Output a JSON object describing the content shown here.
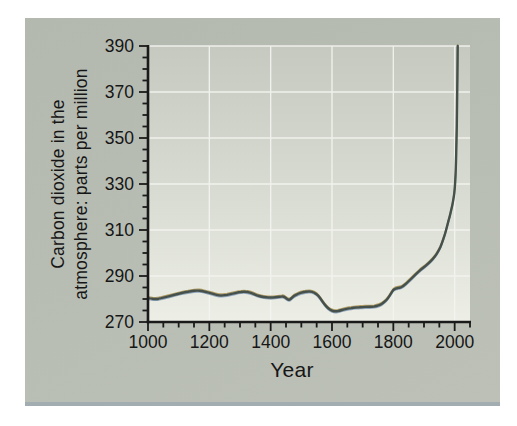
{
  "figure": {
    "xlabel": "Year",
    "ylabel_line1": "Carbon dioxide in the",
    "ylabel_line2": "atmosphere: parts per million",
    "colors": {
      "page_background": "#ffffff",
      "card_background": "#b8bcb3",
      "card_bottom_edge": "#a2adb2",
      "plot_background_top": "#c5c9c0",
      "plot_background_bottom": "#edefe7",
      "gridline": "#f4f5f0",
      "axis": "#1a1a1a",
      "text": "#161616",
      "line_main": "#46514b",
      "line_highlight": "#b29e67",
      "line_shadow": "#90a5bc"
    }
  },
  "chart_data": {
    "type": "line",
    "title": "",
    "xlabel": "Year",
    "ylabel": "Carbon dioxide in the atmosphere: parts per million",
    "xlim": [
      1000,
      2050
    ],
    "ylim": [
      270,
      390
    ],
    "x_major_ticks": [
      1000,
      1200,
      1400,
      1600,
      1800,
      2000
    ],
    "x_tick_labels": [
      "1000",
      "1200",
      "1400",
      "1600",
      "1800",
      "2000"
    ],
    "x_minor_step": 50,
    "y_major_ticks": [
      270,
      290,
      310,
      330,
      350,
      370,
      390
    ],
    "y_tick_labels": [
      "270",
      "290",
      "310",
      "330",
      "350",
      "370",
      "390"
    ],
    "y_minor_step": 5,
    "grid": true,
    "legend": "none",
    "series": [
      {
        "name": "CO2 concentration (ppm)",
        "points": [
          [
            1000,
            280.4
          ],
          [
            1010,
            280.2
          ],
          [
            1020,
            280.0
          ],
          [
            1030,
            280.0
          ],
          [
            1040,
            280.3
          ],
          [
            1060,
            280.9
          ],
          [
            1080,
            281.6
          ],
          [
            1100,
            282.3
          ],
          [
            1120,
            282.9
          ],
          [
            1140,
            283.4
          ],
          [
            1160,
            283.7
          ],
          [
            1175,
            283.5
          ],
          [
            1190,
            283.0
          ],
          [
            1205,
            282.5
          ],
          [
            1220,
            281.9
          ],
          [
            1235,
            281.5
          ],
          [
            1250,
            281.6
          ],
          [
            1265,
            282.0
          ],
          [
            1280,
            282.5
          ],
          [
            1295,
            282.9
          ],
          [
            1310,
            283.2
          ],
          [
            1325,
            283.1
          ],
          [
            1340,
            282.5
          ],
          [
            1355,
            281.6
          ],
          [
            1370,
            281.0
          ],
          [
            1385,
            280.7
          ],
          [
            1400,
            280.6
          ],
          [
            1415,
            280.7
          ],
          [
            1430,
            281.0
          ],
          [
            1442,
            281.2
          ],
          [
            1450,
            280.4
          ],
          [
            1458,
            279.6
          ],
          [
            1465,
            279.9
          ],
          [
            1475,
            281.3
          ],
          [
            1490,
            282.3
          ],
          [
            1505,
            283.0
          ],
          [
            1520,
            283.3
          ],
          [
            1535,
            283.2
          ],
          [
            1550,
            282.2
          ],
          [
            1562,
            280.3
          ],
          [
            1575,
            277.8
          ],
          [
            1588,
            275.8
          ],
          [
            1600,
            274.8
          ],
          [
            1612,
            274.6
          ],
          [
            1625,
            274.9
          ],
          [
            1640,
            275.5
          ],
          [
            1655,
            275.9
          ],
          [
            1670,
            276.2
          ],
          [
            1685,
            276.4
          ],
          [
            1700,
            276.5
          ],
          [
            1715,
            276.6
          ],
          [
            1730,
            276.6
          ],
          [
            1745,
            276.9
          ],
          [
            1758,
            277.5
          ],
          [
            1770,
            278.6
          ],
          [
            1782,
            280.2
          ],
          [
            1793,
            282.6
          ],
          [
            1800,
            284.0
          ],
          [
            1808,
            284.6
          ],
          [
            1816,
            284.8
          ],
          [
            1824,
            285.0
          ],
          [
            1835,
            285.9
          ],
          [
            1848,
            287.5
          ],
          [
            1860,
            289.0
          ],
          [
            1875,
            291.0
          ],
          [
            1890,
            292.8
          ],
          [
            1905,
            294.3
          ],
          [
            1920,
            296.2
          ],
          [
            1935,
            298.3
          ],
          [
            1948,
            301.0
          ],
          [
            1958,
            304.0
          ],
          [
            1968,
            308.0
          ],
          [
            1976,
            312.0
          ],
          [
            1984,
            316.0
          ],
          [
            1990,
            319.5
          ],
          [
            1995,
            322.5
          ],
          [
            1999,
            326.0
          ],
          [
            2002,
            331.0
          ],
          [
            2004,
            338.0
          ],
          [
            2006,
            348.0
          ],
          [
            2008,
            363.0
          ],
          [
            2010,
            390.0
          ]
        ]
      }
    ]
  }
}
